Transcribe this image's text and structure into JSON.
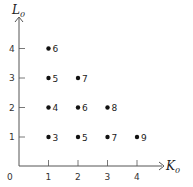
{
  "chart_data": {
    "type": "scatter",
    "title": "",
    "xlabel": "K",
    "xlabel_subscript": "0",
    "ylabel": "L",
    "ylabel_subscript": "0",
    "origin_label": "0",
    "xlim": [
      0,
      4.5
    ],
    "ylim": [
      0,
      4.5
    ],
    "x_ticks": [
      "1",
      "2",
      "3",
      "4"
    ],
    "y_ticks": [
      "1",
      "2",
      "3",
      "4"
    ],
    "grid": false,
    "points": [
      {
        "x": 1,
        "y": 4,
        "label": "6"
      },
      {
        "x": 1,
        "y": 3,
        "label": "5"
      },
      {
        "x": 2,
        "y": 3,
        "label": "7"
      },
      {
        "x": 1,
        "y": 2,
        "label": "4"
      },
      {
        "x": 2,
        "y": 2,
        "label": "6"
      },
      {
        "x": 3,
        "y": 2,
        "label": "8"
      },
      {
        "x": 1,
        "y": 1,
        "label": "3"
      },
      {
        "x": 2,
        "y": 1,
        "label": "5"
      },
      {
        "x": 3,
        "y": 1,
        "label": "7"
      },
      {
        "x": 4,
        "y": 1,
        "label": "9"
      }
    ]
  },
  "colors": {
    "axis": "#555555",
    "point": "#111111",
    "text": "#222222"
  }
}
